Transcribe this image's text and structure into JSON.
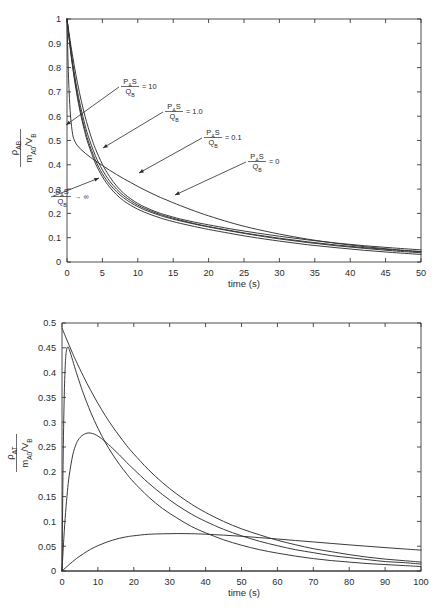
{
  "figure": {
    "background": "#ffffff",
    "curve_color": "#2f2f2f",
    "axis_color": "#3a3a3a"
  },
  "chart_data": [
    {
      "id": "top",
      "type": "line",
      "title": "",
      "xlabel": "time (s)",
      "ylabel": "ρ_AB / (m_A0/V_B)",
      "ylabel_parts": {
        "numerator_rho": "ρ",
        "numerator_sub": "AB",
        "denominator_m": "m",
        "denominator_m_sub": "A0",
        "denominator_div": "/V",
        "denominator_v_sub": "B"
      },
      "xlim": [
        0,
        50
      ],
      "ylim": [
        0,
        1
      ],
      "xticks": [
        0,
        5,
        10,
        15,
        20,
        25,
        30,
        35,
        40,
        45,
        50
      ],
      "xtick_labels": [
        "0",
        "5",
        "10",
        "15",
        "20",
        "25",
        "30",
        "35",
        "40",
        "45",
        "50"
      ],
      "yticks": [
        0,
        0.1,
        0.2,
        0.3,
        0.4,
        0.5,
        0.6,
        0.7,
        0.8,
        0.9,
        1
      ],
      "ytick_labels": [
        "0",
        "0.1",
        "0.2",
        "0.3",
        "0.4",
        "0.5",
        "0.6",
        "0.7",
        "0.8",
        "0.9",
        "1"
      ],
      "grid": false,
      "legend": "none",
      "series": [
        {
          "name": "PAS/QB -> infinity",
          "label_value": "→ ∞",
          "x": [
            0,
            0.15,
            0.3,
            0.5,
            0.8,
            1.1,
            1.5,
            2,
            2.6,
            3.3,
            4,
            5,
            6,
            7,
            8,
            9,
            10,
            11,
            12,
            13,
            14,
            16,
            18,
            20,
            23,
            26,
            30,
            34,
            38,
            42,
            46,
            50
          ],
          "y": [
            1.0,
            0.82,
            0.7,
            0.6,
            0.525,
            0.497,
            0.478,
            0.462,
            0.447,
            0.431,
            0.417,
            0.397,
            0.378,
            0.36,
            0.343,
            0.327,
            0.311,
            0.296,
            0.282,
            0.268,
            0.256,
            0.232,
            0.21,
            0.19,
            0.163,
            0.14,
            0.115,
            0.094,
            0.077,
            0.063,
            0.052,
            0.043
          ]
        },
        {
          "name": "PAS/QB = 10",
          "label_value": "= 10",
          "x": [
            0,
            0.5,
            1,
            1.5,
            2,
            2.5,
            3,
            3.5,
            4,
            5,
            6,
            7,
            8,
            9,
            10,
            11,
            12,
            13,
            14,
            16,
            18,
            20,
            23,
            26,
            30,
            34,
            38,
            42,
            46,
            50
          ],
          "y": [
            1.0,
            0.9,
            0.812,
            0.734,
            0.665,
            0.605,
            0.553,
            0.507,
            0.467,
            0.402,
            0.352,
            0.313,
            0.283,
            0.26,
            0.241,
            0.226,
            0.213,
            0.202,
            0.193,
            0.177,
            0.164,
            0.153,
            0.137,
            0.123,
            0.106,
            0.091,
            0.078,
            0.067,
            0.058,
            0.05
          ]
        },
        {
          "name": "PAS/QB = 1.0",
          "label_value": "= 1.0",
          "x": [
            0,
            0.5,
            1,
            1.5,
            2,
            2.5,
            3,
            4,
            5,
            6,
            7,
            8,
            9,
            10,
            11,
            12,
            13,
            14,
            16,
            18,
            20,
            23,
            26,
            30,
            34,
            38,
            42,
            46,
            50
          ],
          "y": [
            1.0,
            0.882,
            0.783,
            0.699,
            0.629,
            0.569,
            0.518,
            0.438,
            0.379,
            0.334,
            0.3,
            0.273,
            0.252,
            0.234,
            0.22,
            0.208,
            0.197,
            0.188,
            0.172,
            0.158,
            0.146,
            0.13,
            0.115,
            0.098,
            0.083,
            0.07,
            0.059,
            0.05,
            0.042
          ]
        },
        {
          "name": "PAS/QB = 0.1",
          "label_value": "= 0.1",
          "x": [
            0,
            0.5,
            1,
            1.5,
            2,
            2.5,
            3,
            4,
            5,
            6,
            7,
            8,
            9,
            10,
            11,
            12,
            13,
            14,
            16,
            18,
            20,
            23,
            26,
            30,
            34,
            38,
            42,
            46,
            50
          ],
          "y": [
            1.0,
            0.873,
            0.768,
            0.681,
            0.609,
            0.549,
            0.498,
            0.42,
            0.363,
            0.321,
            0.289,
            0.264,
            0.244,
            0.228,
            0.214,
            0.203,
            0.193,
            0.184,
            0.169,
            0.156,
            0.144,
            0.128,
            0.113,
            0.095,
            0.08,
            0.067,
            0.056,
            0.046,
            0.038
          ]
        },
        {
          "name": "PAS/QB = 0",
          "label_value": "= 0",
          "x": [
            0,
            0.5,
            1,
            1.5,
            2,
            2.5,
            3,
            4,
            5,
            6,
            7,
            8,
            9,
            10,
            11,
            12,
            13,
            14,
            16,
            18,
            20,
            23,
            26,
            30,
            34,
            38,
            42,
            46,
            50
          ],
          "y": [
            1.0,
            0.869,
            0.761,
            0.672,
            0.598,
            0.537,
            0.486,
            0.407,
            0.351,
            0.309,
            0.277,
            0.252,
            0.233,
            0.217,
            0.204,
            0.193,
            0.183,
            0.174,
            0.159,
            0.146,
            0.134,
            0.118,
            0.103,
            0.086,
            0.071,
            0.059,
            0.048,
            0.039,
            0.031
          ]
        }
      ],
      "annotations": [
        {
          "id": "top-ann-10",
          "value": "= 10",
          "text_x": 130,
          "text_y": 86,
          "tip_x": 66,
          "tip_y": 125
        },
        {
          "id": "top-ann-1",
          "value": "= 1.0",
          "text_x": 174,
          "text_y": 111,
          "tip_x": 103,
          "tip_y": 148
        },
        {
          "id": "top-ann-01",
          "value": "= 0.1",
          "text_x": 213,
          "text_y": 137,
          "tip_x": 139,
          "tip_y": 173
        },
        {
          "id": "top-ann-0",
          "value": "= 0",
          "text_x": 257,
          "text_y": 161,
          "tip_x": 175,
          "tip_y": 195
        },
        {
          "id": "top-ann-inf",
          "value": "→ ∞",
          "text_x": 62,
          "text_y": 196,
          "tip_x": 99,
          "tip_y": 178
        }
      ]
    },
    {
      "id": "bottom",
      "type": "line",
      "title": "",
      "xlabel": "time (s)",
      "ylabel": "ρ_AT / (m_A0/V_B)",
      "ylabel_parts": {
        "numerator_rho": "ρ",
        "numerator_sub": "AT",
        "denominator_m": "m",
        "denominator_m_sub": "A0",
        "denominator_div": "/V",
        "denominator_v_sub": "B"
      },
      "xlim": [
        0,
        100
      ],
      "ylim": [
        0,
        0.5
      ],
      "xticks": [
        0,
        10,
        20,
        30,
        40,
        50,
        60,
        70,
        80,
        90,
        100
      ],
      "xtick_labels": [
        "0",
        "10",
        "20",
        "30",
        "40",
        "50",
        "60",
        "70",
        "80",
        "90",
        "100"
      ],
      "yticks": [
        0,
        0.05,
        0.1,
        0.15,
        0.2,
        0.25,
        0.3,
        0.35,
        0.4,
        0.45,
        0.5
      ],
      "ytick_labels": [
        "0",
        "0.05",
        "0.1",
        "0.15",
        "0.2",
        "0.25",
        "0.3",
        "0.35",
        "0.4",
        "0.45",
        "0.5"
      ],
      "grid": false,
      "legend": "none",
      "series": [
        {
          "name": "PAS/QB -> infinity",
          "label_value": "→ ∞",
          "x": [
            0,
            1,
            2,
            3,
            4,
            6,
            8,
            10,
            12,
            14,
            16,
            18,
            20,
            24,
            28,
            32,
            36,
            40,
            45,
            50,
            55,
            60,
            65,
            70,
            75,
            80,
            85,
            90,
            95,
            100
          ],
          "y": [
            0.49,
            0.472,
            0.455,
            0.438,
            0.422,
            0.392,
            0.364,
            0.338,
            0.314,
            0.292,
            0.272,
            0.253,
            0.236,
            0.205,
            0.178,
            0.155,
            0.135,
            0.118,
            0.1,
            0.085,
            0.073,
            0.062,
            0.053,
            0.045,
            0.039,
            0.033,
            0.028,
            0.024,
            0.021,
            0.018
          ]
        },
        {
          "name": "PAS/QB = 10",
          "label_value": "= 10",
          "x": [
            0,
            0.3,
            0.6,
            0.9,
            1.2,
            1.6,
            2,
            2.5,
            3,
            4,
            5,
            6,
            8,
            10,
            12,
            14,
            16,
            18,
            20,
            24,
            28,
            32,
            36,
            40,
            45,
            50,
            55,
            60,
            65,
            70,
            75,
            80,
            85,
            90,
            95,
            100
          ],
          "y": [
            0.0,
            0.215,
            0.345,
            0.414,
            0.443,
            0.452,
            0.447,
            0.436,
            0.424,
            0.4,
            0.378,
            0.357,
            0.32,
            0.288,
            0.26,
            0.236,
            0.215,
            0.196,
            0.179,
            0.15,
            0.126,
            0.107,
            0.09,
            0.077,
            0.063,
            0.052,
            0.043,
            0.036,
            0.03,
            0.025,
            0.021,
            0.018,
            0.015,
            0.013,
            0.011,
            0.009
          ]
        },
        {
          "name": "PAS/QB = 1.0",
          "label_value": "= 1.0",
          "x": [
            0,
            0.5,
            1,
            1.5,
            2,
            3,
            4,
            5,
            6,
            7,
            8,
            9,
            10,
            11,
            12,
            14,
            16,
            18,
            20,
            24,
            28,
            32,
            36,
            40,
            45,
            50,
            55,
            60,
            65,
            70,
            75,
            80,
            85,
            90,
            95,
            100
          ],
          "y": [
            0.0,
            0.065,
            0.118,
            0.16,
            0.192,
            0.234,
            0.257,
            0.269,
            0.275,
            0.278,
            0.278,
            0.276,
            0.272,
            0.267,
            0.261,
            0.248,
            0.234,
            0.219,
            0.205,
            0.178,
            0.154,
            0.133,
            0.115,
            0.1,
            0.084,
            0.071,
            0.06,
            0.051,
            0.043,
            0.037,
            0.031,
            0.027,
            0.023,
            0.019,
            0.017,
            0.014
          ]
        },
        {
          "name": "PAS/QB = 0.1",
          "label_value": "= 0.1",
          "x": [
            0,
            2,
            4,
            6,
            8,
            10,
            12,
            14,
            16,
            18,
            20,
            24,
            28,
            32,
            36,
            40,
            45,
            50,
            55,
            60,
            65,
            70,
            75,
            80,
            85,
            90,
            95,
            100
          ],
          "y": [
            0.0,
            0.013,
            0.025,
            0.035,
            0.044,
            0.051,
            0.057,
            0.062,
            0.066,
            0.069,
            0.071,
            0.074,
            0.075,
            0.0755,
            0.0752,
            0.0742,
            0.0723,
            0.07,
            0.0673,
            0.0645,
            0.0615,
            0.0586,
            0.0556,
            0.0527,
            0.0499,
            0.0472,
            0.0446,
            0.0421
          ]
        },
        {
          "name": "PAS/QB = 0",
          "label_value": "= 0",
          "x": [
            0,
            20,
            40,
            60,
            80,
            100
          ],
          "y": [
            0,
            0,
            0,
            0,
            0,
            0
          ]
        }
      ],
      "annotations": [
        {
          "id": "bot-ann-inf",
          "value": "→ ∞",
          "text_x": 128,
          "text_y": 338,
          "tip_x": 86,
          "tip_y": 357
        },
        {
          "id": "bot-ann-10",
          "value": "= 10",
          "text_x": 146,
          "text_y": 368,
          "tip_x": 85,
          "tip_y": 387
        },
        {
          "id": "bot-ann-1",
          "value": "= 1.0",
          "text_x": 104,
          "text_y": 478,
          "tip_x": 94,
          "tip_y": 452
        },
        {
          "id": "bot-ann-01",
          "value": "= 0.1",
          "text_x": 138,
          "text_y": 516,
          "tip_x": 112,
          "tip_y": 538
        },
        {
          "id": "bot-ann-0",
          "value": "= 0",
          "text_x": 182,
          "text_y": 545,
          "tip_x": 155,
          "tip_y": 573
        }
      ]
    }
  ],
  "symbols": {
    "p_letter": "P",
    "p_sub": "A",
    "s_letter": "S",
    "q_letter": "Q",
    "q_sub": "B",
    "time_label": "time (s)"
  }
}
